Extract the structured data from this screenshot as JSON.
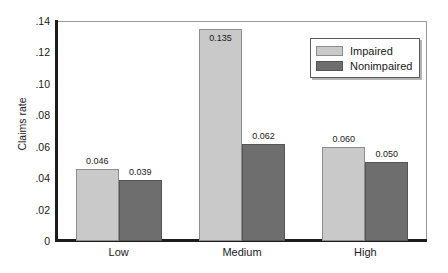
{
  "chart_data": {
    "type": "bar",
    "title": "",
    "xlabel": "",
    "ylabel": "Claims rate",
    "categories": [
      "Low",
      "Medium",
      "High"
    ],
    "series": [
      {
        "name": "Impaired",
        "color": "#c9c9c9",
        "values": [
          0.046,
          0.135,
          0.06
        ],
        "value_labels": [
          "0.046",
          "0.135",
          "0.060"
        ]
      },
      {
        "name": "Nonimpaired",
        "color": "#6e6e6e",
        "values": [
          0.039,
          0.062,
          0.05
        ],
        "value_labels": [
          "0.039",
          "0.062",
          "0.050"
        ]
      }
    ],
    "ylim": [
      0,
      0.14
    ],
    "ytick_values": [
      0,
      0.02,
      0.04,
      0.06,
      0.08,
      0.1,
      0.12,
      0.14
    ],
    "ytick_labels": [
      "0",
      ".02",
      ".04",
      ".06",
      ".08",
      ".10",
      ".12",
      ".14"
    ],
    "grid": false,
    "legend_position": "top-right"
  },
  "legend": {
    "items": [
      {
        "label": "Impaired",
        "color": "#c9c9c9"
      },
      {
        "label": "Nonimpaired",
        "color": "#6e6e6e"
      }
    ]
  }
}
